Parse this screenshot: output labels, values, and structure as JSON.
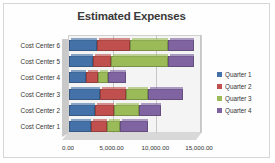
{
  "chart_data": {
    "type": "bar",
    "orientation": "horizontal",
    "stacked": true,
    "style": "3-D stacked bar",
    "title": "Estimated Expenses",
    "xlabel": "",
    "ylabel": "",
    "xlim": [
      0,
      15000
    ],
    "grid": true,
    "legend_position": "right",
    "categories": [
      "Cost Center 1",
      "Cost Center 2",
      "Cost Center 3",
      "Cost Center 4",
      "Cost Center 5",
      "Cost Center 6"
    ],
    "xticks": [
      0,
      5000,
      10000,
      15000
    ],
    "xticklabels": [
      "0.00",
      "5,000.00",
      "10,000.00",
      "15,000.00"
    ],
    "series": [
      {
        "name": "Quarter 1",
        "color": "#4472a8",
        "values": [
          2500,
          3000,
          3500,
          2000,
          2800,
          3200
        ]
      },
      {
        "name": "Quarter 2",
        "color": "#c0504d",
        "values": [
          1800,
          2200,
          3000,
          1300,
          2000,
          3800
        ]
      },
      {
        "name": "Quarter 3",
        "color": "#9bbb59",
        "values": [
          1500,
          2800,
          2500,
          1200,
          6500,
          4300
        ]
      },
      {
        "name": "Quarter 4",
        "color": "#8064a2",
        "values": [
          3200,
          2500,
          4000,
          2000,
          3000,
          3000
        ]
      }
    ],
    "totals": [
      9000,
      10500,
      13000,
      6500,
      14300,
      14300
    ]
  },
  "legend": {
    "items": [
      {
        "label": "Quarter 1"
      },
      {
        "label": "Quarter 2"
      },
      {
        "label": "Quarter 3"
      },
      {
        "label": "Quarter 4"
      }
    ]
  }
}
